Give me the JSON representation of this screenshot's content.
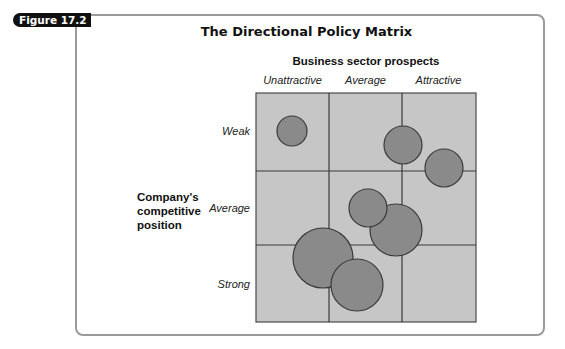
{
  "figure_tag": "Figure 17.2",
  "title": "The Directional Policy Matrix",
  "x_axis": {
    "title": "Business sector prospects",
    "categories": [
      "Unattractive",
      "Average",
      "Attractive"
    ]
  },
  "y_axis": {
    "title_lines": [
      "Company's",
      "competitive",
      "position"
    ],
    "categories": [
      "Weak",
      "Average",
      "Strong"
    ]
  },
  "colors": {
    "cell_fill": "#c6c6c6",
    "grid_line": "#4a4a4a",
    "bubble_fill": "#8a8a8a",
    "bubble_stroke": "#3a3a3a",
    "frame": "#9a9a9a"
  },
  "bubbles": [
    {
      "cx": 292,
      "cy": 131,
      "r": 15
    },
    {
      "cx": 403,
      "cy": 145,
      "r": 19
    },
    {
      "cx": 444,
      "cy": 168,
      "r": 19
    },
    {
      "cx": 396,
      "cy": 230,
      "r": 26
    },
    {
      "cx": 368,
      "cy": 208,
      "r": 19
    },
    {
      "cx": 323,
      "cy": 258,
      "r": 30
    },
    {
      "cx": 357,
      "cy": 285,
      "r": 26
    }
  ]
}
